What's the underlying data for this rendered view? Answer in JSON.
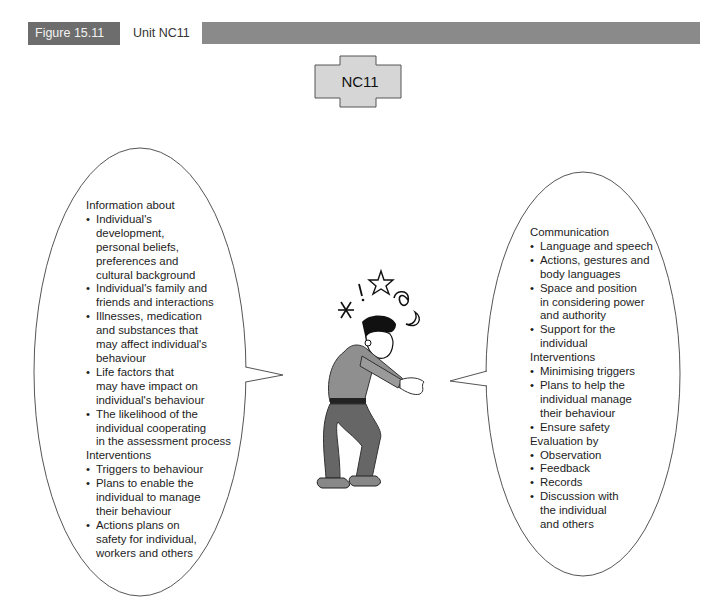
{
  "header": {
    "figure_number": "Figure 15.11",
    "title": "Unit NC11",
    "colors": {
      "label_bg": "#6d6d6d",
      "bar_bg": "#8a8a8a"
    }
  },
  "unit_box": {
    "label": "NC11",
    "fill": "#d6d6d6",
    "stroke": "#555555"
  },
  "illustration": {
    "description": "stressed man in crouched pose with symbols above head",
    "symbols": [
      "asterisk",
      "exclamation",
      "star",
      "spiral",
      "crescent-moon"
    ]
  },
  "left_bubble": {
    "sections": [
      {
        "heading": "Information about",
        "items": [
          "Individual's\ndevelopment,\npersonal beliefs,\npreferences and\ncultural background",
          "Individual's family and\nfriends and interactions",
          "Illnesses, medication\nand substances that\nmay affect individual's\nbehaviour",
          "Life factors that\nmay have impact on\nindividual's behaviour",
          "The likelihood of the\nindividual cooperating\nin the assessment process"
        ]
      },
      {
        "heading": "Interventions",
        "items": [
          "Triggers to behaviour",
          "Plans to enable the\nindividual to manage\ntheir behaviour",
          "Actions plans on\nsafety for individual,\nworkers and others"
        ]
      }
    ]
  },
  "right_bubble": {
    "sections": [
      {
        "heading": "Communication",
        "items": [
          "Language and speech",
          "Actions, gestures and\nbody languages",
          "Space and position\nin considering power\nand authority",
          "Support for the\nindividual"
        ]
      },
      {
        "heading": "Interventions",
        "items": [
          "Minimising triggers",
          "Plans to help the\nindividual manage\ntheir behaviour",
          "Ensure safety"
        ]
      },
      {
        "heading": "Evaluation by",
        "items": [
          "Observation",
          "Feedback",
          "Records",
          "Discussion with\nthe individual\nand others"
        ]
      }
    ]
  }
}
